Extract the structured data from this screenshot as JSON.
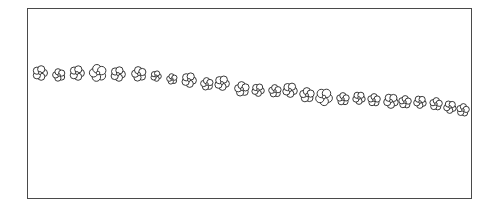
{
  "figure": {
    "stroke_color": "#222222",
    "frame_color": "#4a4a4a",
    "background": "#ffffff"
  },
  "flowers": [
    {
      "x": 40,
      "y": 73,
      "r": 7
    },
    {
      "x": 59,
      "y": 75,
      "r": 6
    },
    {
      "x": 77,
      "y": 73,
      "r": 7
    },
    {
      "x": 98,
      "y": 73,
      "r": 8
    },
    {
      "x": 118,
      "y": 74,
      "r": 7
    },
    {
      "x": 139,
      "y": 74,
      "r": 7
    },
    {
      "x": 156,
      "y": 76,
      "r": 5
    },
    {
      "x": 172,
      "y": 79,
      "r": 5
    },
    {
      "x": 189,
      "y": 80,
      "r": 7
    },
    {
      "x": 207,
      "y": 84,
      "r": 6
    },
    {
      "x": 222,
      "y": 83,
      "r": 7
    },
    {
      "x": 242,
      "y": 89,
      "r": 7
    },
    {
      "x": 258,
      "y": 90,
      "r": 6
    },
    {
      "x": 275,
      "y": 91,
      "r": 6
    },
    {
      "x": 290,
      "y": 90,
      "r": 7
    },
    {
      "x": 307,
      "y": 95,
      "r": 7
    },
    {
      "x": 324,
      "y": 97,
      "r": 8
    },
    {
      "x": 343,
      "y": 99,
      "r": 6
    },
    {
      "x": 359,
      "y": 98,
      "r": 6
    },
    {
      "x": 374,
      "y": 100,
      "r": 6
    },
    {
      "x": 391,
      "y": 101,
      "r": 7
    },
    {
      "x": 405,
      "y": 102,
      "r": 6
    },
    {
      "x": 420,
      "y": 102,
      "r": 6
    },
    {
      "x": 436,
      "y": 104,
      "r": 6
    },
    {
      "x": 450,
      "y": 107,
      "r": 6
    },
    {
      "x": 463,
      "y": 110,
      "r": 6
    }
  ]
}
